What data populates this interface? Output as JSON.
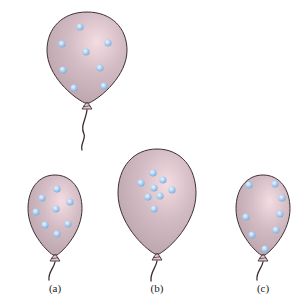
{
  "figure": {
    "colors": {
      "balloon_fill_light": "#f3dde3",
      "balloon_fill_mid": "#d3bcc3",
      "balloon_fill_dark": "#b9a3ab",
      "balloon_outline": "#3e3035",
      "particle_light": "#eef6ff",
      "particle_mid": "#a9cdee",
      "particle_dark": "#7aa9d6",
      "string": "#3a2c30",
      "knot": "#e7c9d3"
    },
    "balloons": [
      {
        "id": "top",
        "label": "",
        "cx": 87,
        "top": 12,
        "bottom": 103,
        "rx": 40,
        "knot_y": 104,
        "string": "M87 110 C 86 120, 80 126, 84 134 C 86 139, 80 144, 82 150",
        "particles": [
          [
            80,
            27
          ],
          [
            62,
            44
          ],
          [
            108,
            43
          ],
          [
            86,
            52
          ],
          [
            63,
            70
          ],
          [
            100,
            68
          ],
          [
            74,
            88
          ],
          [
            104,
            86
          ]
        ]
      },
      {
        "id": "a",
        "label": "(a)",
        "cx": 55,
        "top": 175,
        "bottom": 255,
        "rx": 27,
        "knot_y": 256,
        "string": "M55 262 C 54 268, 48 272, 49 280",
        "particles": [
          [
            57,
            189
          ],
          [
            42,
            198
          ],
          [
            70,
            202
          ],
          [
            56,
            209
          ],
          [
            36,
            212
          ],
          [
            45,
            225
          ],
          [
            68,
            224
          ],
          [
            57,
            234
          ]
        ]
      },
      {
        "id": "b",
        "label": "(b)",
        "cx": 157,
        "top": 149,
        "bottom": 254,
        "rx": 39,
        "knot_y": 255,
        "string": "M157 261 C 156 268, 150 272, 151 281",
        "particles": [
          [
            153,
            173
          ],
          [
            141,
            183
          ],
          [
            163,
            180
          ],
          [
            154,
            188
          ],
          [
            172,
            190
          ],
          [
            148,
            197
          ],
          [
            160,
            196
          ],
          [
            154,
            209
          ]
        ]
      },
      {
        "id": "c",
        "label": "(c)",
        "cx": 263,
        "top": 175,
        "bottom": 255,
        "rx": 27,
        "knot_y": 256,
        "string": "M263 262 C 262 268, 256 272, 257 280",
        "particles": [
          [
            249,
            185
          ],
          [
            275,
            184
          ],
          [
            282,
            198
          ],
          [
            280,
            214
          ],
          [
            246,
            217
          ],
          [
            276,
            230
          ],
          [
            252,
            235
          ],
          [
            265,
            249
          ]
        ]
      }
    ],
    "labels": [
      {
        "text": "(a)",
        "x": 55,
        "y": 282
      },
      {
        "text": "(b)",
        "x": 157,
        "y": 282
      },
      {
        "text": "(c)",
        "x": 263,
        "y": 282
      }
    ]
  }
}
